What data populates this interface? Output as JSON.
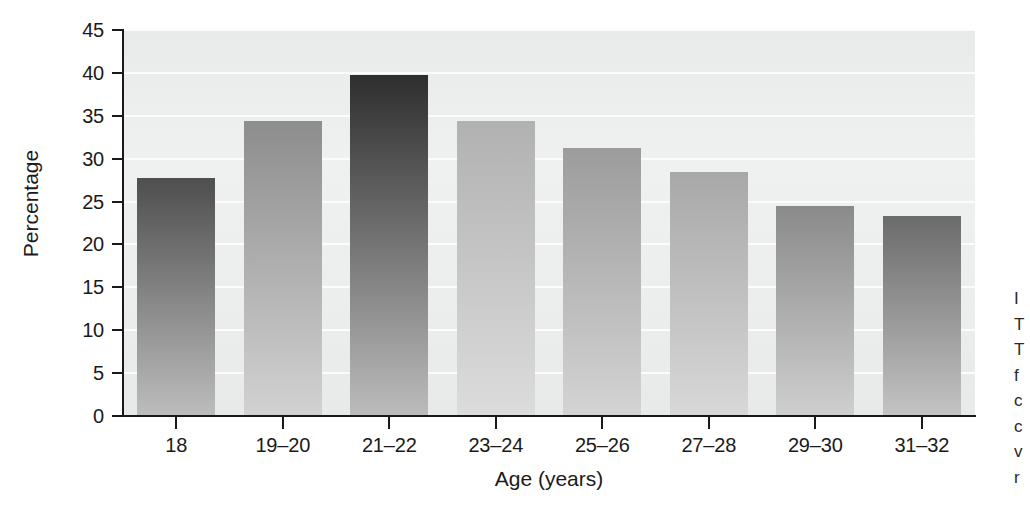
{
  "figure": {
    "background_color": "#ffffff",
    "plot_background_color": "#eef0ef",
    "axis_color": "#18191a",
    "gridline_color": "#ffffff"
  },
  "chart_data": {
    "type": "bar",
    "title": "",
    "subtitle": "",
    "xlabel": "Age (years)",
    "ylabel": "Percentage",
    "categories": [
      "18",
      "19–20",
      "21–22",
      "23–24",
      "25–26",
      "27–28",
      "29–30",
      "31–32"
    ],
    "values": [
      27.7,
      34.4,
      39.7,
      34.4,
      31.3,
      28.4,
      24.5,
      23.3
    ],
    "ylim": [
      0,
      45
    ],
    "ytick_values": [
      0,
      5,
      10,
      15,
      20,
      25,
      30,
      35,
      40,
      45
    ],
    "ytick_labels": [
      "0",
      "5",
      "10",
      "15",
      "20",
      "25",
      "30",
      "35",
      "40",
      "45"
    ],
    "grid": true,
    "grid_axis": "y",
    "legend": false,
    "legend_position": "none",
    "bar_gradient": "vertical dark-to-light",
    "bar_top_colors": [
      "#4e4e4e",
      "#8d8d8d",
      "#2e2e2e",
      "#b1b1b1",
      "#9c9c9c",
      "#a8a8a8",
      "#8a8a8a",
      "#6b6b6b"
    ],
    "bar_bottom_colors": [
      "#bdbdbd",
      "#d2d2d2",
      "#bcbcbc",
      "#dcdcdc",
      "#d4d4d4",
      "#d8d8d8",
      "#cfcfcf",
      "#c4c4c4"
    ]
  },
  "caption_fragment": {
    "lines": [
      "I",
      "T",
      "T",
      "f",
      "c",
      "c",
      "v",
      "r"
    ]
  }
}
